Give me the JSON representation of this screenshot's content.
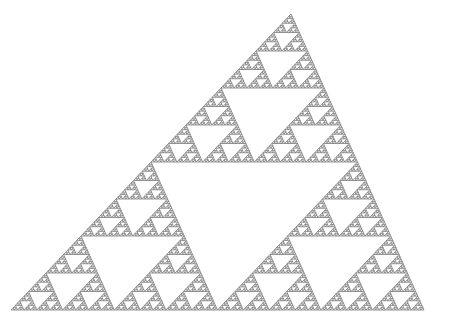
{
  "canvas": {
    "width": 450,
    "height": 325,
    "background": "#ffffff"
  },
  "figure": {
    "type": "sierpinski-triangle",
    "vertices": {
      "bottom_left": [
        11,
        310
      ],
      "bottom_right": [
        424,
        310
      ],
      "apex": [
        291,
        14
      ]
    },
    "recursion_depth": 7,
    "stroke_color": "#7a7a7a",
    "stroke_width": 0.8,
    "fill_color": "none"
  }
}
